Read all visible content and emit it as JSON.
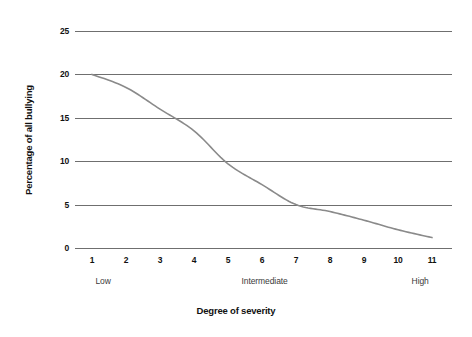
{
  "chart_data": {
    "type": "line",
    "title": "",
    "xlabel": "Degree of severity",
    "ylabel": "Percentage of all bullying",
    "x": [
      1,
      2,
      3,
      4,
      5,
      6,
      7,
      8,
      9,
      10,
      11
    ],
    "categories": [
      "1",
      "2",
      "3",
      "4",
      "5",
      "6",
      "7",
      "8",
      "9",
      "10",
      "11"
    ],
    "values": [
      20.0,
      18.5,
      16.0,
      13.5,
      9.7,
      7.3,
      5.0,
      4.2,
      3.2,
      2.1,
      1.2
    ],
    "series": [
      {
        "name": "Percentage of all bullying",
        "values": [
          20.0,
          18.5,
          16.0,
          13.5,
          9.7,
          7.3,
          5.0,
          4.2,
          3.2,
          2.1,
          1.2
        ]
      }
    ],
    "ylim": [
      0,
      25
    ],
    "yticks": [
      0,
      5,
      10,
      15,
      20,
      25
    ],
    "ytick_labels": [
      "0",
      "5",
      "10",
      "15",
      "20",
      "25"
    ],
    "xlim": [
      1,
      11
    ],
    "xticks": [
      1,
      2,
      3,
      4,
      5,
      6,
      7,
      8,
      9,
      10,
      11
    ],
    "xtick_labels": [
      "1",
      "2",
      "3",
      "4",
      "5",
      "6",
      "7",
      "8",
      "9",
      "10",
      "11"
    ],
    "grid": true,
    "grid_axis": "y",
    "legend": false,
    "legend_position": "none",
    "line_color": "#8a8a8a",
    "grid_color": "#6f6f6f",
    "background": "#ffffff",
    "band_labels": [
      {
        "text": "Low",
        "at_x": 1.1
      },
      {
        "text": "Intermediate",
        "at_x": 5.4
      },
      {
        "text": "High",
        "at_x": 10.4
      }
    ]
  }
}
